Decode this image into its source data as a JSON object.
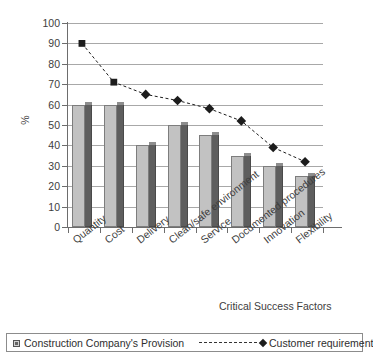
{
  "chart_data": {
    "type": "bar",
    "title": "",
    "xlabel": "Critical Success Factors",
    "ylabel": "%",
    "ylim": [
      0,
      100
    ],
    "ytick_step": 10,
    "yticks": [
      100,
      90,
      80,
      70,
      60,
      50,
      40,
      30,
      20,
      10,
      0
    ],
    "grid": true,
    "legend_position": "bottom",
    "categories": [
      "Quantity",
      "Cost",
      "Delivery",
      "Clean/safe environment",
      "Service",
      "Documented procedures",
      "Innovation",
      "Flexibility"
    ],
    "series": [
      {
        "name": "Construction Company's Provision",
        "type": "bar",
        "values": [
          60,
          60,
          40,
          50,
          45,
          35,
          30,
          25
        ],
        "color": "#c2c2c2",
        "side_color": "#5e5e5e"
      },
      {
        "name": "Customer requirement",
        "type": "line",
        "values": [
          90,
          71,
          65,
          62,
          58,
          52,
          39,
          32
        ],
        "color": "#1c1c1c",
        "linestyle": "dashed",
        "marker": "diamond"
      }
    ]
  },
  "axes": {
    "y_title": "%",
    "x_title": "Critical Success Factors"
  },
  "legend": {
    "items": [
      {
        "label": "Construction Company's Provision",
        "marker": "square-swatch-icon"
      },
      {
        "label": "Customer requirement",
        "marker": "diamond-marker-icon"
      }
    ]
  }
}
